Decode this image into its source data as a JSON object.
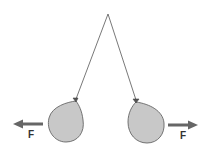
{
  "diagram": {
    "pivot": {
      "x": 108,
      "y": 14
    },
    "strings": {
      "color": "#555555"
    },
    "balloons": [
      {
        "id": "left",
        "fill": "#c8c8c8",
        "stroke": "#666666"
      },
      {
        "id": "right",
        "fill": "#c8c8c8",
        "stroke": "#666666"
      }
    ],
    "forces": [
      {
        "id": "left",
        "label": "F",
        "direction": "left",
        "color": "#666666"
      },
      {
        "id": "right",
        "label": "F",
        "direction": "right",
        "color": "#666666"
      }
    ]
  }
}
